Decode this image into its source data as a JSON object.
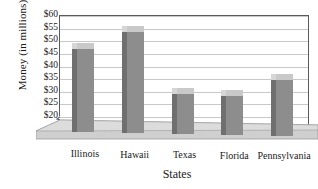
{
  "chart_data": {
    "type": "bar",
    "title": "",
    "xlabel": "States",
    "ylabel": "Money (in millions)",
    "categories": [
      "Illinois",
      "Hawaii",
      "Texas",
      "Florida",
      "Pennsylvania"
    ],
    "values": [
      46,
      53,
      28.5,
      27.5,
      34
    ],
    "value_prefix": "$",
    "ylim": [
      20,
      60
    ],
    "y_axis_has_break": true,
    "y_break_between": [
      0,
      20
    ],
    "ytick_labels": [
      "$60",
      "$55",
      "$50",
      "$45",
      "$40",
      "$35",
      "$30",
      "$25",
      "$20",
      "0"
    ],
    "ytick_values": [
      60,
      55,
      50,
      45,
      40,
      35,
      30,
      25,
      20,
      0
    ],
    "ytick_step": 5,
    "grid": true,
    "grid_axis": "y",
    "legend": "none",
    "style": "3d-column",
    "colors": {
      "bar_front": "#8d8d8d",
      "bar_side": "#6f6f6f",
      "bar_top": "#d6d6d6",
      "grid": "#c9c9c9",
      "axis": "#5a5a5a",
      "floor": "#cfcfcf",
      "background": "#ffffff",
      "text": "#1a1a1a"
    }
  }
}
